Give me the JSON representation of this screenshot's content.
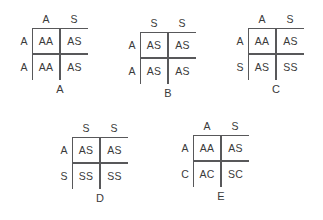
{
  "diagram": {
    "line_color": "#58585a",
    "text_color": "#3a3a3a",
    "background_color": "#ffffff",
    "squares": [
      {
        "id": "A",
        "label": "A",
        "x": 16,
        "y": 13,
        "col_headers": [
          "A",
          "S"
        ],
        "row_headers": [
          "A",
          "A"
        ],
        "cells": [
          [
            "AA",
            "AS"
          ],
          [
            "AA",
            "AS"
          ]
        ]
      },
      {
        "id": "B",
        "label": "B",
        "x": 124,
        "y": 17,
        "col_headers": [
          "S",
          "S"
        ],
        "row_headers": [
          "A",
          "A"
        ],
        "cells": [
          [
            "AS",
            "AS"
          ],
          [
            "AS",
            "AS"
          ]
        ]
      },
      {
        "id": "C",
        "label": "C",
        "x": 232,
        "y": 13,
        "col_headers": [
          "A",
          "S"
        ],
        "row_headers": [
          "A",
          "S"
        ],
        "cells": [
          [
            "AA",
            "AS"
          ],
          [
            "AS",
            "SS"
          ]
        ]
      },
      {
        "id": "D",
        "label": "D",
        "x": 56,
        "y": 122,
        "col_headers": [
          "S",
          "S"
        ],
        "row_headers": [
          "A",
          "S"
        ],
        "cells": [
          [
            "AS",
            "AS"
          ],
          [
            "SS",
            "SS"
          ]
        ]
      },
      {
        "id": "E",
        "label": "E",
        "x": 177,
        "y": 120,
        "col_headers": [
          "A",
          "S"
        ],
        "row_headers": [
          "A",
          "C"
        ],
        "cells": [
          [
            "AA",
            "AS"
          ],
          [
            "AC",
            "SC"
          ]
        ]
      }
    ]
  }
}
